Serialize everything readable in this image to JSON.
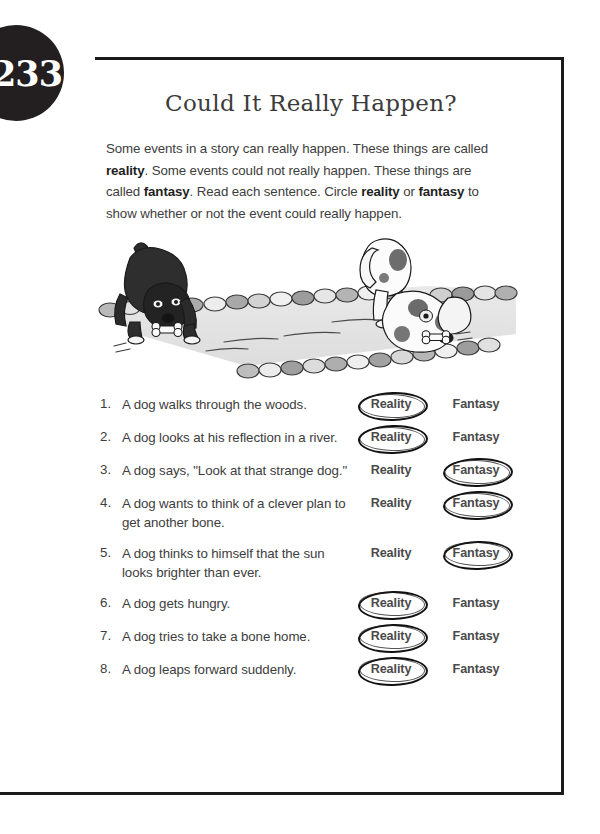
{
  "page": {
    "number": "233",
    "title": "Could It Really Happen?",
    "intro_part1": "Some events in a story can really happen. These things are called ",
    "intro_bold1": "reality",
    "intro_part2": ". Some events could not really happen. These things are called ",
    "intro_bold2": "fantasy",
    "intro_part3": ". Read each sentence. Circle ",
    "intro_bold3": "reality",
    "intro_part4": " or ",
    "intro_bold4": "fantasy",
    "intro_part5": " to show whether or not the event could really happen."
  },
  "illustration": {
    "caption": "Two dogs at a stone-lined stream; a dark dog with a bone faces a spotted dog looking at its reflection in the water",
    "icon": "two-dogs-stream-illustration"
  },
  "choices": {
    "reality_label": "Reality",
    "fantasy_label": "Fantasy"
  },
  "questions": [
    {
      "num": "1.",
      "text": "A dog walks through the woods.",
      "answer": "Reality"
    },
    {
      "num": "2.",
      "text": "A dog looks at his reflection in a river.",
      "answer": "Reality"
    },
    {
      "num": "3.",
      "text": "A dog says, \"Look at that strange dog.\"",
      "answer": "Fantasy"
    },
    {
      "num": "4.",
      "text": "A dog wants to think of a clever plan to get another bone.",
      "answer": "Fantasy"
    },
    {
      "num": "5.",
      "text": "A dog thinks to himself that the sun looks brighter than ever.",
      "answer": "Fantasy"
    },
    {
      "num": "6.",
      "text": "A dog gets hungry.",
      "answer": "Reality"
    },
    {
      "num": "7.",
      "text": "A dog tries to take a bone home.",
      "answer": "Reality"
    },
    {
      "num": "8.",
      "text": "A dog leaps forward suddenly.",
      "answer": "Reality"
    }
  ],
  "colors": {
    "ink": "#231f20",
    "body_text": "#3d3d3d",
    "choice_text": "#4a4a4a",
    "circle_mark": "#111111"
  }
}
